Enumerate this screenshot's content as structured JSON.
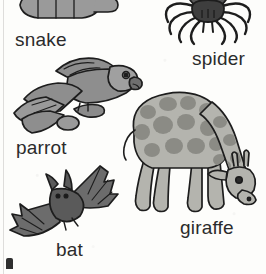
{
  "page": {
    "kind": "scanned picture-dictionary page",
    "background_color": "#fdfdfb",
    "text_color": "#2b2b2b",
    "ink_outline_color": "#1d1d1d"
  },
  "entries": [
    {
      "id": "snake",
      "label": "snake",
      "icon": "snake-illustration",
      "note": "coiled snake, cropped at top of page, body segments with tail to the right",
      "fill": "#9a9a9a",
      "shade": "#828282",
      "label_x": 15,
      "label_y": 30
    },
    {
      "id": "spider",
      "label": "spider",
      "icon": "spider-illustration",
      "note": "dark spider seen from above, cropped at top of page, eight legs",
      "fill": "#585858",
      "shade": "#3e3e3e",
      "label_x": 192,
      "label_y": 49
    },
    {
      "id": "parrot",
      "label": "parrot",
      "icon": "parrot-illustration",
      "note": "parrot with spread wing facing right, perched on a branch",
      "fill": "#8e8e8e",
      "shade": "#757575",
      "label_x": 16,
      "label_y": 138
    },
    {
      "id": "bat",
      "label": "bat",
      "icon": "bat-illustration",
      "note": "bat in flight with outstretched wings",
      "fill": "#6c6c6c",
      "shade": "#565656",
      "label_x": 56,
      "label_y": 240
    },
    {
      "id": "giraffe",
      "label": "giraffe",
      "icon": "giraffe-illustration",
      "note": "giraffe bending its long neck down to the right, spotted coat",
      "fill": "#b4b4ae",
      "shade": "#8b8b85",
      "label_x": 180,
      "label_y": 218
    }
  ],
  "artifacts": {
    "gutter_line": "left page-edge scan line",
    "cut_glyph": "top sliver of a letter from the next row, bottom-left"
  }
}
